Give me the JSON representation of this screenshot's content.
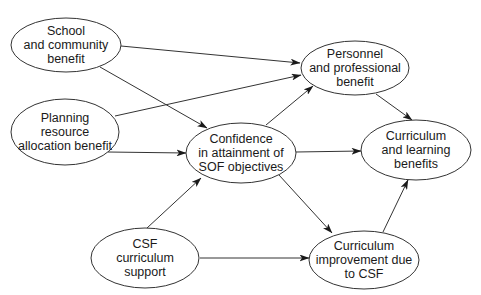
{
  "colors": {
    "stroke": "#333333",
    "text": "#1a1a1a",
    "background": "#ffffff"
  },
  "nodes": [
    {
      "id": "school",
      "label": "School\nand community\nbenefit",
      "cx": 66,
      "cy": 45,
      "rx": 55,
      "ry": 27
    },
    {
      "id": "planning",
      "label": "Planning\nresource\nallocation benefit",
      "cx": 65,
      "cy": 132,
      "rx": 54,
      "ry": 33
    },
    {
      "id": "confidence",
      "label": "Confidence\nin attainment of\nSOF objectives",
      "cx": 241,
      "cy": 153,
      "rx": 55,
      "ry": 30
    },
    {
      "id": "personnel",
      "label": "Personnel\nand professional\nbenefit",
      "cx": 355,
      "cy": 68,
      "rx": 54,
      "ry": 27
    },
    {
      "id": "curr_learning",
      "label": "Curriculum\nand learning\nbenefits",
      "cx": 416,
      "cy": 150,
      "rx": 55,
      "ry": 30
    },
    {
      "id": "csf",
      "label": "CSF\ncurriculum\nsupport",
      "cx": 145,
      "cy": 258,
      "rx": 54,
      "ry": 30
    },
    {
      "id": "curr_improvement",
      "label": "Curriculum\nimprovement due\nto CSF",
      "cx": 364,
      "cy": 260,
      "rx": 55,
      "ry": 29
    }
  ],
  "edges": [
    {
      "from": "school",
      "to": "personnel",
      "x1": 121,
      "y1": 46,
      "x2": 300,
      "y2": 63
    },
    {
      "from": "school",
      "to": "confidence",
      "x1": 100,
      "y1": 67,
      "x2": 207,
      "y2": 128
    },
    {
      "from": "planning",
      "to": "personnel",
      "x1": 115,
      "y1": 116,
      "x2": 301,
      "y2": 75
    },
    {
      "from": "planning",
      "to": "confidence",
      "x1": 108,
      "y1": 152,
      "x2": 186,
      "y2": 153
    },
    {
      "from": "confidence",
      "to": "personnel",
      "x1": 266,
      "y1": 125,
      "x2": 313,
      "y2": 86
    },
    {
      "from": "confidence",
      "to": "curr_learning",
      "x1": 296,
      "y1": 152,
      "x2": 361,
      "y2": 151
    },
    {
      "from": "confidence",
      "to": "curr_improvement",
      "x1": 279,
      "y1": 175,
      "x2": 332,
      "y2": 233
    },
    {
      "from": "personnel",
      "to": "curr_learning",
      "x1": 376,
      "y1": 94,
      "x2": 412,
      "y2": 120
    },
    {
      "from": "csf",
      "to": "confidence",
      "x1": 147,
      "y1": 228,
      "x2": 201,
      "y2": 178
    },
    {
      "from": "csf",
      "to": "curr_improvement",
      "x1": 200,
      "y1": 258,
      "x2": 309,
      "y2": 258
    },
    {
      "from": "curr_improvement",
      "to": "curr_learning",
      "x1": 383,
      "y1": 232,
      "x2": 408,
      "y2": 180
    }
  ]
}
